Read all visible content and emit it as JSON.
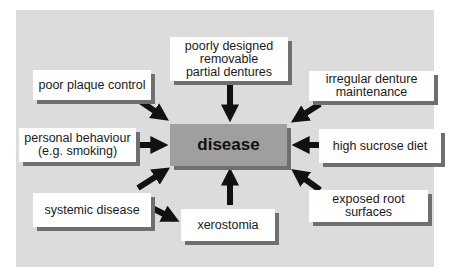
{
  "diagram": {
    "center": {
      "label": "disease"
    },
    "factors": [
      {
        "id": "poorly-designed-dentures",
        "label": "poorly designed\nremovable\npartial dentures"
      },
      {
        "id": "poor-plaque-control",
        "label": "poor plaque control"
      },
      {
        "id": "irregular-denture-maintenance",
        "label": "irregular denture\nmaintenance"
      },
      {
        "id": "personal-behaviour",
        "label": "personal behaviour\n(e.g. smoking)"
      },
      {
        "id": "high-sucrose-diet",
        "label": "high sucrose diet"
      },
      {
        "id": "systemic-disease",
        "label": "systemic disease"
      },
      {
        "id": "xerostomia",
        "label": "xerostomia"
      },
      {
        "id": "exposed-root-surfaces",
        "label": "exposed root\nsurfaces"
      }
    ],
    "colors": {
      "panel": "#dcdcdc",
      "center": "#9f9f9f",
      "box": "#ffffff",
      "shadow": "#6f6f6f",
      "arrow": "#111111"
    }
  }
}
